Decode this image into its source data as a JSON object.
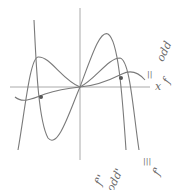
{
  "diagram": {
    "title": "",
    "axis_x_label": "x",
    "colors": {
      "curve": "#777777",
      "axis": "#999999",
      "label": "#6a6a6a",
      "point": "#555555"
    },
    "curves": [
      {
        "name": "f",
        "description": "cubic-like curve with local max near x=-40 and local max near x=40, crossing origin"
      },
      {
        "name": "f-prime",
        "description": "steep curve through origin, peaks at right, dips at left"
      },
      {
        "name": "f-double-prime",
        "description": "flatter curve through origin with marked points"
      }
    ],
    "labels": {
      "right_top_1": "||",
      "right_top_2": "odd",
      "right_top_3": "f",
      "bottom_1": "f''",
      "bottom_2": "odd'",
      "bottom_3": "|||",
      "bottom_4": "f'"
    }
  }
}
